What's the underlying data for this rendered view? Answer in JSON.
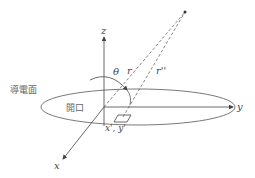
{
  "diagram": {
    "labels": {
      "z_axis": "z",
      "y_axis": "y",
      "x_axis": "x",
      "theta": "θ",
      "r": "r",
      "r_double_prime": "r''",
      "source_point": "x', y'",
      "conducting_plane": "導電面",
      "aperture": "開口"
    },
    "colors": {
      "line": "#444444",
      "text": "#444444",
      "cjk_text": "#666666",
      "background": "#ffffff"
    }
  }
}
